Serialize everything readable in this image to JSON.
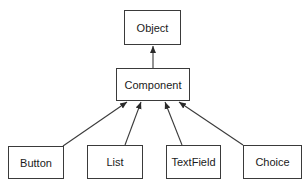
{
  "diagram": {
    "type": "class-hierarchy",
    "nodes": {
      "object": {
        "label": "Object"
      },
      "component": {
        "label": "Component"
      },
      "button": {
        "label": "Button"
      },
      "list": {
        "label": "List"
      },
      "textfield": {
        "label": "TextField"
      },
      "choice": {
        "label": "Choice"
      }
    },
    "edges": [
      {
        "from": "Component",
        "to": "Object"
      },
      {
        "from": "Button",
        "to": "Component"
      },
      {
        "from": "List",
        "to": "Component"
      },
      {
        "from": "TextField",
        "to": "Component"
      },
      {
        "from": "Choice",
        "to": "Component"
      }
    ],
    "colors": {
      "line": "#3a3a3a",
      "text": "#1a1a1a",
      "background": "#ffffff"
    }
  }
}
